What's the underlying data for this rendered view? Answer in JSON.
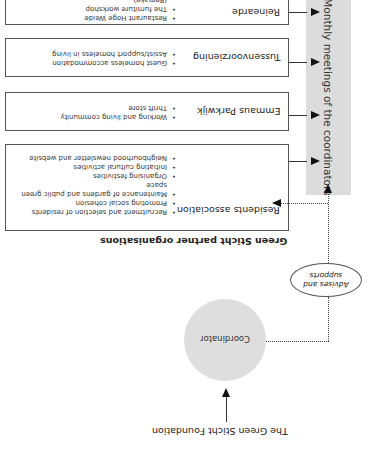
{
  "orientation": "rotated-180",
  "title": "The Green Sticht Foundation",
  "coordinator": {
    "label": "Coordinator"
  },
  "advises": {
    "label_line1": "Advises and",
    "label_line2": "supports"
  },
  "partners_caption": "Green Sticht partner organisations",
  "meetings_label": "Monthly meetings of the coordinators",
  "organisations": [
    {
      "name": "Residents association",
      "items": [
        "Recruitment and selection of residents",
        "Promoting social cohesion",
        "Maintenance of gardens and public green space",
        "Organising festivities",
        "Initiating cultural activities",
        "Neighbourhood newsletter and website"
      ]
    },
    {
      "name": "Emmaus Parkwijk",
      "items": [
        "Working and living community",
        "Thrift store"
      ]
    },
    {
      "name": "Tussenvoorziening",
      "items": [
        "Guest homeless accommodation",
        "Assist/support homeless in living"
      ]
    },
    {
      "name": "Reinearde",
      "items": [
        "Restaurant Hoge Weide",
        "The furniture workshop (Remake)"
      ]
    }
  ],
  "colors": {
    "grey_fill": "#dcdcdc",
    "circle_fill": "#dedede",
    "line": "#333333"
  }
}
